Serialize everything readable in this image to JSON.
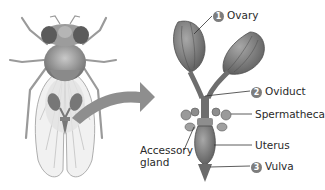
{
  "diagram": {
    "labels": [
      {
        "id": "ovary",
        "number": "1",
        "text": "Ovary"
      },
      {
        "id": "oviduct",
        "number": "2",
        "text": "Oviduct"
      },
      {
        "id": "spermatheca",
        "number": "",
        "text": "Spermatheca"
      },
      {
        "id": "accessory-gland",
        "number": "",
        "text_line1": "Accessory",
        "text_line2": "gland"
      },
      {
        "id": "uterus",
        "number": "",
        "text": "Uterus"
      },
      {
        "id": "vulva",
        "number": "3",
        "text": "Vulva"
      }
    ],
    "colors": {
      "organ": "#8a8a8a",
      "organ_dark": "#5e5e5e",
      "arrow": "#8c8c8c",
      "badge": "#7d7d7d",
      "text": "#2a2a2a"
    }
  }
}
